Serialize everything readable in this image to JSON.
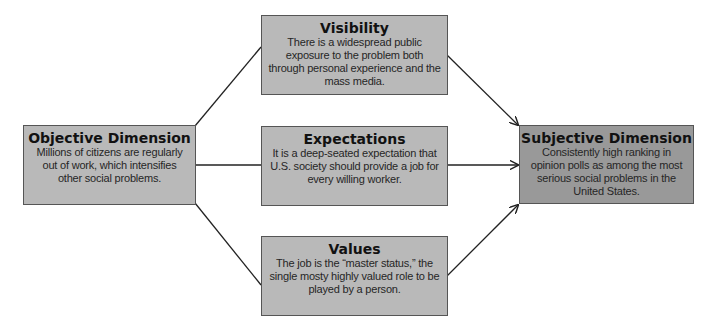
{
  "diagram": {
    "type": "flow",
    "colors": {
      "node_fill": "#b9b9b9",
      "target_fill": "#999999",
      "border": "#555555",
      "line": "#222222"
    },
    "nodes": {
      "objective": {
        "title": "Objective Dimension",
        "body": "Millions of citizens are regularly out of work, which intensifies other social problems."
      },
      "visibility": {
        "title": "Visibility",
        "body": "There is a widespread public exposure to the problem both through personal experience and the mass media."
      },
      "expectations": {
        "title": "Expectations",
        "body": "It is a deep-seated expectation that U.S. society should provide a job for every willing worker."
      },
      "values": {
        "title": "Values",
        "body": "The job is the “master status,” the single mosty highly valued role to be played by a person."
      },
      "subjective": {
        "title": "Subjective Dimension",
        "body": "Consistently high ranking in opinion polls as among the most serious social problems in the United States."
      }
    },
    "edges": [
      {
        "from": "objective",
        "to": "visibility",
        "arrow": false
      },
      {
        "from": "objective",
        "to": "expectations",
        "arrow": false
      },
      {
        "from": "objective",
        "to": "values",
        "arrow": false
      },
      {
        "from": "visibility",
        "to": "subjective",
        "arrow": true
      },
      {
        "from": "expectations",
        "to": "subjective",
        "arrow": true
      },
      {
        "from": "values",
        "to": "subjective",
        "arrow": true
      }
    ]
  }
}
